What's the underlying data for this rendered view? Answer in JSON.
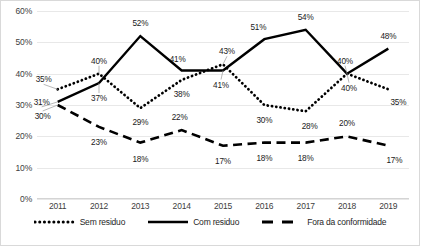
{
  "chart_data": {
    "type": "line",
    "title": "",
    "xlabel": "",
    "ylabel": "",
    "categories": [
      "2011",
      "2012",
      "2013",
      "2014",
      "2015",
      "2016",
      "2017",
      "2018",
      "2019"
    ],
    "ylim": [
      0,
      60
    ],
    "yticks": [
      "0%",
      "10%",
      "20%",
      "30%",
      "40%",
      "50%",
      "60%"
    ],
    "ytick_values": [
      0,
      10,
      20,
      30,
      40,
      50,
      60
    ],
    "grid": true,
    "legend_position": "bottom",
    "series": [
      {
        "name": "Sem residuo",
        "style": "dotted",
        "color": "#000000",
        "values": [
          35,
          40,
          29,
          38,
          43,
          30,
          28,
          40,
          35
        ],
        "labels": [
          "35%",
          "40%",
          "29%",
          "38%",
          "43%",
          "30%",
          "28%",
          "40%",
          "35%"
        ]
      },
      {
        "name": "Com residuo",
        "style": "solid",
        "color": "#000000",
        "values": [
          31,
          37,
          52,
          41,
          41,
          51,
          54,
          40,
          48
        ],
        "labels": [
          "31%",
          "37%",
          "52%",
          "41%",
          "41%",
          "51%",
          "54%",
          "40%",
          "48%"
        ]
      },
      {
        "name": "Fora da conformidade",
        "style": "dashed",
        "color": "#000000",
        "values": [
          30,
          23,
          18,
          22,
          17,
          18,
          18,
          20,
          17
        ],
        "labels": [
          "30%",
          "23%",
          "18%",
          "22%",
          "17%",
          "18%",
          "18%",
          "20%",
          "17%"
        ]
      }
    ],
    "label_offsets": {
      "Sem residuo": [
        [
          -14,
          -10
        ],
        [
          0,
          -13
        ],
        [
          0,
          14
        ],
        [
          0,
          14
        ],
        [
          4,
          -13
        ],
        [
          0,
          15
        ],
        [
          4,
          15
        ],
        [
          2,
          14
        ],
        [
          10,
          13
        ]
      ],
      "Com residuo": [
        [
          -16,
          0
        ],
        [
          0,
          15
        ],
        [
          0,
          -13
        ],
        [
          -4,
          -12
        ],
        [
          -2,
          14
        ],
        [
          -6,
          -12
        ],
        [
          0,
          -13
        ],
        [
          -2,
          -13
        ],
        [
          0,
          -13
        ]
      ],
      "Fora da conformidade": [
        [
          -15,
          11
        ],
        [
          0,
          15
        ],
        [
          0,
          16
        ],
        [
          -2,
          -13
        ],
        [
          0,
          15
        ],
        [
          0,
          15
        ],
        [
          0,
          15
        ],
        [
          0,
          -13
        ],
        [
          6,
          14
        ]
      ]
    },
    "leaders": [
      {
        "from_series": "Sem residuo",
        "from_index": 0
      },
      {
        "from_series": "Com residuo",
        "from_index": 0
      },
      {
        "from_series": "Fora da conformidade",
        "from_index": 0
      },
      {
        "from_series": "Sem residuo",
        "from_index": 1
      },
      {
        "from_series": "Com residuo",
        "from_index": 1
      },
      {
        "from_series": "Sem residuo",
        "from_index": 4
      },
      {
        "from_series": "Com residuo",
        "from_index": 4
      },
      {
        "from_series": "Sem residuo",
        "from_index": 7
      },
      {
        "from_series": "Com residuo",
        "from_index": 7
      }
    ]
  },
  "legend": {
    "items": [
      {
        "label": "Sem residuo",
        "style": "dotted"
      },
      {
        "label": "Com residuo",
        "style": "solid"
      },
      {
        "label": "Fora da conformidade",
        "style": "dashed"
      }
    ]
  }
}
